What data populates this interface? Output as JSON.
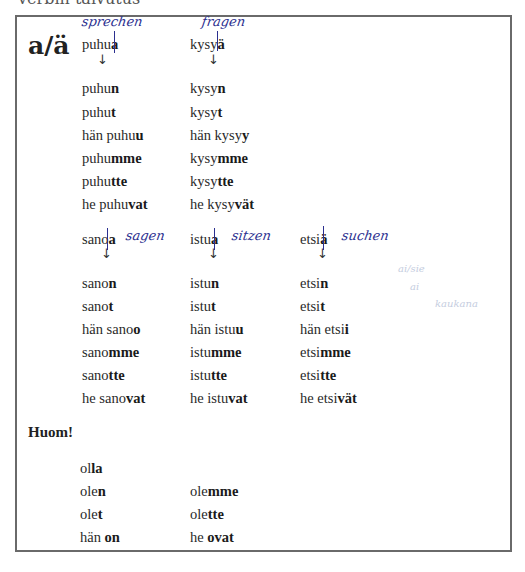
{
  "page": {
    "top_cut_text": "verbin taivutus",
    "heading": "a/ä",
    "group1": {
      "columns": [
        {
          "infinitive": {
            "stem": "puhu",
            "ending": "a"
          },
          "annotation": "sprechen",
          "forms": [
            {
              "pre": "puhu",
              "ending": "n"
            },
            {
              "pre": "puhu",
              "ending": "t"
            },
            {
              "pre": "hän puhu",
              "ending": "u"
            },
            {
              "pre": "puhu",
              "ending": "mme"
            },
            {
              "pre": "puhu",
              "ending": "tte"
            },
            {
              "pre": "he puhu",
              "ending": "vat"
            }
          ]
        },
        {
          "infinitive": {
            "stem": "kysy",
            "ending": "ä"
          },
          "annotation": "fragen",
          "forms": [
            {
              "pre": "kysy",
              "ending": "n"
            },
            {
              "pre": "kysy",
              "ending": "t"
            },
            {
              "pre": "hän kysy",
              "ending": "y"
            },
            {
              "pre": "kysy",
              "ending": "mme"
            },
            {
              "pre": "kysy",
              "ending": "tte"
            },
            {
              "pre": "he kysy",
              "ending": "vät"
            }
          ]
        }
      ]
    },
    "group2": {
      "columns": [
        {
          "infinitive": {
            "stem": "sano",
            "ending": "a"
          },
          "annotation": "sagen",
          "forms": [
            {
              "pre": "sano",
              "ending": "n"
            },
            {
              "pre": "sano",
              "ending": "t"
            },
            {
              "pre": "hän sano",
              "ending": "o"
            },
            {
              "pre": "sano",
              "ending": "mme"
            },
            {
              "pre": "sano",
              "ending": "tte"
            },
            {
              "pre": "he sano",
              "ending": "vat"
            }
          ]
        },
        {
          "infinitive": {
            "stem": "istu",
            "ending": "a"
          },
          "annotation": "sitzen",
          "forms": [
            {
              "pre": "istu",
              "ending": "n"
            },
            {
              "pre": "istu",
              "ending": "t"
            },
            {
              "pre": "hän istu",
              "ending": "u"
            },
            {
              "pre": "istu",
              "ending": "mme"
            },
            {
              "pre": "istu",
              "ending": "tte"
            },
            {
              "pre": "he istu",
              "ending": "vat"
            }
          ]
        },
        {
          "infinitive": {
            "stem": "etsi",
            "ending": "ä"
          },
          "annotation": "suchen",
          "forms": [
            {
              "pre": "etsi",
              "ending": "n"
            },
            {
              "pre": "etsi",
              "ending": "t"
            },
            {
              "pre": "hän etsi",
              "ending": "i"
            },
            {
              "pre": "etsi",
              "ending": "mme"
            },
            {
              "pre": "etsi",
              "ending": "tte"
            },
            {
              "pre": "he etsi",
              "ending": "vät"
            }
          ]
        }
      ]
    },
    "faint_notes": [
      "ai/sie",
      "ai",
      "kaukana"
    ],
    "huom": {
      "label": "Huom!",
      "infinitive": {
        "stem": "ol",
        "ending": "la"
      },
      "left": [
        {
          "pre": "ole",
          "ending": "n"
        },
        {
          "pre": "ole",
          "ending": "t"
        },
        {
          "pre": "hän ",
          "ending": "on"
        }
      ],
      "right": [
        {
          "pre": "ole",
          "ending": "mme"
        },
        {
          "pre": "ole",
          "ending": "tte"
        },
        {
          "pre": "he ",
          "ending": "ovat"
        }
      ]
    },
    "arrow_glyph": "↓"
  }
}
